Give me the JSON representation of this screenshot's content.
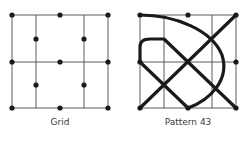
{
  "figures": [
    {
      "label": "Grid",
      "grid_lines": {
        "vertical_x": [
          12,
          36,
          84,
          108
        ],
        "horizontal_y": [
          15,
          62,
          108
        ],
        "span": {
          "x0": 12,
          "x1": 108,
          "y0": 15,
          "y1": 108
        }
      },
      "dots": [
        [
          12,
          15
        ],
        [
          60,
          15
        ],
        [
          108,
          15
        ],
        [
          36,
          39
        ],
        [
          84,
          39
        ],
        [
          12,
          62
        ],
        [
          60,
          62
        ],
        [
          108,
          62
        ],
        [
          36,
          85
        ],
        [
          84,
          85
        ],
        [
          12,
          108
        ],
        [
          60,
          108
        ],
        [
          108,
          108
        ]
      ]
    },
    {
      "label": "Pattern 43",
      "grid_lines": {
        "vertical_x": [
          140,
          164,
          212,
          236
        ],
        "horizontal_y": [
          15,
          62,
          108
        ],
        "span": {
          "x0": 140,
          "x1": 236,
          "y0": 15,
          "y1": 108
        }
      },
      "dots": [
        [
          140,
          15
        ],
        [
          188,
          15
        ],
        [
          236,
          15
        ],
        [
          140,
          62
        ],
        [
          236,
          62
        ],
        [
          140,
          108
        ],
        [
          188,
          108
        ],
        [
          236,
          108
        ]
      ],
      "paths": [
        "M140,108 L236,15",
        "M140,62 L140,47 Q140,39 150,39 L164,39 L236,108",
        "M140,62 L188,108",
        "M140,15 C175,15 212,30 222,55 C230,80 210,100 188,108"
      ]
    }
  ],
  "colors": {
    "ink": "#1a1a1a",
    "grid": "#333333",
    "label": "#3a3a3a"
  }
}
